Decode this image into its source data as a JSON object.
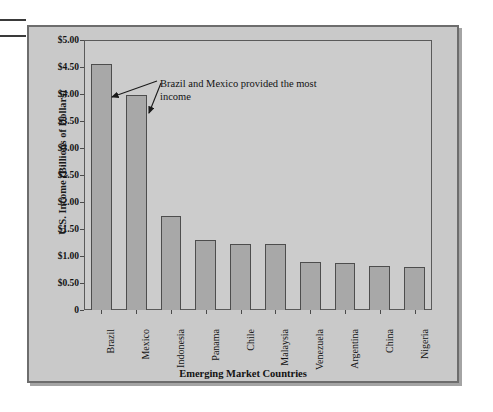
{
  "figure": {
    "annotation": "Brazil and Mexico provided the most income",
    "watermark": ""
  },
  "chart_data": {
    "type": "bar",
    "title": "",
    "xlabel": "Emerging Market Countries",
    "ylabel": "U.S. Income (Billions of Dollars)",
    "categories": [
      "Brazil",
      "Mexico",
      "Indonesia",
      "Panama",
      "Chile",
      "Malaysia",
      "Venezuela",
      "Argentina",
      "China",
      "Nigeria"
    ],
    "values": [
      4.55,
      3.98,
      1.75,
      1.3,
      1.22,
      1.22,
      0.88,
      0.87,
      0.82,
      0.8
    ],
    "ylim": [
      0,
      5.0
    ],
    "ytick_values": [
      0,
      0.5,
      1.0,
      1.5,
      2.0,
      2.5,
      3.0,
      3.5,
      4.0,
      4.5,
      5.0
    ],
    "ytick_labels": [
      "0",
      "$0.50",
      "$1.00",
      "$1.50",
      "$2.00",
      "$2.50",
      "$3.00",
      "$3.50",
      "$4.00",
      "$4.50",
      "$5.00"
    ],
    "grid": false,
    "legend": null,
    "annotations": [
      {
        "text": "Brazil and Mexico provided the most income",
        "targets": [
          "Brazil",
          "Mexico"
        ]
      }
    ],
    "colors": {
      "bar_fill": "#a8a8a8",
      "bar_edge": "#4d4d4d",
      "plot_background": "#cccccc",
      "figure_background": "#c9c9c9",
      "frame": "#6d6d6d",
      "text": "#131313"
    }
  }
}
